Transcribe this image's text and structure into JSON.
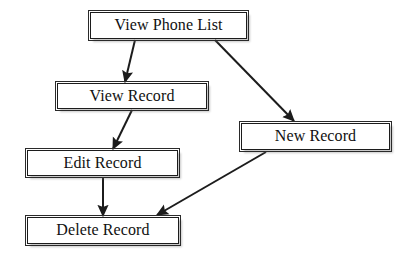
{
  "diagram": {
    "type": "flowchart",
    "background_color": "#ffffff",
    "node_fill_color": "#ffffff",
    "node_border_color": "#1c1c1c",
    "edge_color": "#1c1c1c",
    "text_color": "#111111",
    "nodes": [
      {
        "id": "view-phone-list",
        "label": "View Phone List",
        "x": 90,
        "y": 12,
        "width": 157,
        "height": 27,
        "font_size": 16
      },
      {
        "id": "view-record",
        "label": "View Record",
        "x": 57,
        "y": 83,
        "width": 150,
        "height": 26,
        "font_size": 16
      },
      {
        "id": "new-record",
        "label": "New Record",
        "x": 241,
        "y": 123,
        "width": 149,
        "height": 27,
        "font_size": 16
      },
      {
        "id": "edit-record",
        "label": "Edit Record",
        "x": 27,
        "y": 150,
        "width": 151,
        "height": 26,
        "font_size": 16
      },
      {
        "id": "delete-record",
        "label": "Delete Record",
        "x": 27,
        "y": 217,
        "width": 152,
        "height": 27,
        "font_size": 16
      }
    ],
    "edges": [
      {
        "id": "edge-view-phone-list-to-view-record",
        "from": "view-phone-list",
        "to": "view-record",
        "x1": 135,
        "y1": 40,
        "x2": 125,
        "y2": 82,
        "arrowhead": "filled-triangle"
      },
      {
        "id": "edge-view-phone-list-to-new-record",
        "from": "view-phone-list",
        "to": "new-record",
        "x1": 215,
        "y1": 40,
        "x2": 294,
        "y2": 121,
        "arrowhead": "filled-triangle"
      },
      {
        "id": "edge-view-record-to-edit-record",
        "from": "view-record",
        "to": "edit-record",
        "x1": 132,
        "y1": 110,
        "x2": 113,
        "y2": 149,
        "arrowhead": "filled-triangle"
      },
      {
        "id": "edge-edit-record-to-delete-record",
        "from": "edit-record",
        "to": "delete-record",
        "x1": 103,
        "y1": 177,
        "x2": 103,
        "y2": 216,
        "arrowhead": "filled-triangle"
      },
      {
        "id": "edge-new-record-to-delete-record",
        "from": "new-record",
        "to": "delete-record",
        "x1": 266,
        "y1": 152,
        "x2": 157,
        "y2": 215,
        "arrowhead": "filled-triangle"
      }
    ]
  }
}
